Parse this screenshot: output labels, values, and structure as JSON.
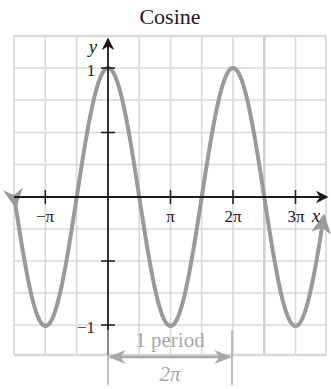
{
  "chart_data": {
    "type": "line",
    "title": "Cosine",
    "function": "y = cos(x)",
    "xlabel": "x",
    "ylabel": "y",
    "xlim": [
      -4.712,
      10.996
    ],
    "ylim": [
      -1.25,
      1.25
    ],
    "x_ticks": [
      {
        "value": -3.14159,
        "label": "−π"
      },
      {
        "value": 3.14159,
        "label": "π"
      },
      {
        "value": 6.28319,
        "label": "2π"
      },
      {
        "value": 9.42478,
        "label": "3π"
      }
    ],
    "y_ticks": [
      {
        "value": 1,
        "label": "1"
      },
      {
        "value": 0.5,
        "label": ""
      },
      {
        "value": -0.5,
        "label": ""
      },
      {
        "value": -1,
        "label": "−1"
      }
    ],
    "grid": true,
    "grid_spacing_x": "π/2",
    "grid_spacing_y": 0.25,
    "series": [
      {
        "name": "cos x",
        "color": "#9a9a9a",
        "x": [
          -4.712,
          -3.142,
          -1.571,
          0,
          1.571,
          3.142,
          4.712,
          6.283,
          7.854,
          9.425,
          10.996
        ],
        "y": [
          0,
          -1,
          0,
          1,
          0,
          -1,
          0,
          1,
          0,
          -1,
          0
        ]
      }
    ],
    "annotations": [
      {
        "type": "bracket",
        "from": 0,
        "to": 6.28319,
        "label_top": "1 period",
        "label_bottom": "2π",
        "color": "#a8a8a8"
      }
    ]
  },
  "labels": {
    "title": "Cosine",
    "x_axis": "x",
    "y_axis": "y",
    "tick_neg_pi": "−π",
    "tick_pi": "π",
    "tick_2pi": "2π",
    "tick_3pi": "3π",
    "tick_y_1": "1",
    "tick_y_neg1": "−1",
    "period_text": "1 period",
    "period_value": "2π"
  },
  "colors": {
    "grid": "#d9d9d9",
    "curve": "#9a9a9a",
    "axis": "#1a1a1a",
    "annotation": "#a8a8a8"
  }
}
